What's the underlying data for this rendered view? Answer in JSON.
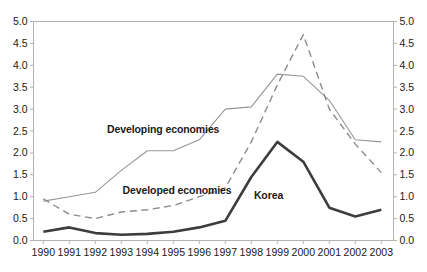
{
  "chart_data": {
    "type": "line",
    "title": "",
    "xlabel": "",
    "ylabel": "",
    "x_tick_labels": [
      "1990",
      "1991",
      "1992",
      "1993",
      "1994",
      "1995",
      "1996",
      "1997",
      "1998",
      "1999",
      "2000",
      "2001",
      "2002",
      "2003"
    ],
    "years": [
      1990,
      1991,
      1992,
      1993,
      1994,
      1995,
      1996,
      1997,
      1998,
      1999,
      2000,
      2001,
      2002,
      2003
    ],
    "ylim": [
      0.0,
      5.0
    ],
    "y_tick_step": 0.5,
    "y_tick_labels": [
      "0.0",
      "0.5",
      "1.0",
      "1.5",
      "2.0",
      "2.5",
      "3.0",
      "3.5",
      "4.0",
      "4.5",
      "5.0"
    ],
    "y_axis_sides": [
      "left",
      "right"
    ],
    "grid": false,
    "legend_position": "inline-annotations",
    "axis_color": "#b3b3b3",
    "text_color": "#1a1a1a",
    "series": [
      {
        "name": "Developing economies",
        "line_style": "solid",
        "line_width": 1.1,
        "color": "#969696",
        "values": [
          0.9,
          1.0,
          1.1,
          1.6,
          2.05,
          2.05,
          2.3,
          3.0,
          3.05,
          3.8,
          3.75,
          3.2,
          2.3,
          2.25
        ]
      },
      {
        "name": "Developed economies",
        "line_style": "dashed",
        "line_width": 1.4,
        "color": "#8c8c8c",
        "values": [
          0.95,
          0.6,
          0.5,
          0.65,
          0.7,
          0.8,
          1.0,
          1.2,
          2.25,
          3.55,
          4.7,
          3.0,
          2.2,
          1.55
        ]
      },
      {
        "name": "Korea",
        "line_style": "solid",
        "line_width": 2.6,
        "color": "#3d3d3d",
        "values": [
          0.2,
          0.3,
          0.17,
          0.13,
          0.15,
          0.2,
          0.3,
          0.45,
          1.45,
          2.25,
          1.8,
          0.75,
          0.55,
          0.7
        ]
      }
    ],
    "annotations": [
      {
        "text": "Developing economies",
        "year": 1992.45,
        "value": 2.45
      },
      {
        "text": "Developed economies",
        "year": 1993.05,
        "value": 1.06
      },
      {
        "text": "Korea",
        "year": 1998.1,
        "value": 0.94
      }
    ]
  }
}
